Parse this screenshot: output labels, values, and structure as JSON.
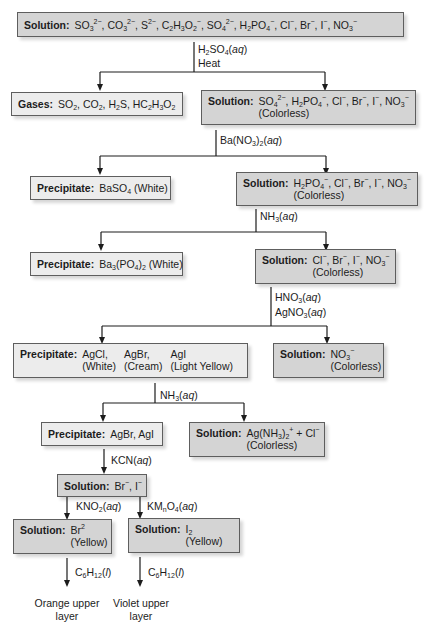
{
  "diagram": {
    "type": "flowchart",
    "nodes": {
      "start": {
        "label": "Solution:",
        "html": "SO<sub>3</sub><sup>2&minus;</sup>, CO<sub>3</sub><sup>2&minus;</sup>, S<sup>2&minus;</sup>, C<sub>2</sub>H<sub>3</sub>O<sub>2</sub><sup>&minus;</sup>, SO<sub>4</sub><sup>2&minus;</sup>, H<sub>2</sub>PO<sub>4</sub><sup>&minus;</sup>, Cl<sup>&minus;</sup>, Br<sup>&minus;</sup>, I<sup>&minus;</sup>, NO<sub>3</sub><sup>&minus;</sup>",
        "text": "SO3^2-, CO3^2-, S^2-, C2H3O2^-, SO4^2-, H2PO4^-, Cl^-, Br^-, I^-, NO3^-"
      },
      "gases": {
        "label": "Gases:",
        "html": "SO<sub>2</sub>, CO<sub>2</sub>, H<sub>2</sub>S, HC<sub>2</sub>H<sub>3</sub>O<sub>2</sub>",
        "text": "SO2, CO2, H2S, HC2H3O2"
      },
      "sol1": {
        "label": "Solution:",
        "html": "SO<sub>4</sub><sup>2&minus;</sup>, H<sub>2</sub>PO<sub>4</sub><sup>&minus;</sup>, Cl<sup>&minus;</sup>, Br<sup>&minus;</sup>, I<sup>&minus;</sup>, NO<sub>3</sub><sup>&minus;</sup>",
        "text": "SO4^2-, H2PO4^-, Cl^-, Br^-, I^-, NO3^-",
        "note": "(Colorless)"
      },
      "ppt1": {
        "label": "Precipitate:",
        "html": "BaSO<sub>4</sub> (White)",
        "text": "BaSO4 (White)"
      },
      "sol2": {
        "label": "Solution:",
        "html": "H<sub>2</sub>PO<sub>4</sub><sup>&minus;</sup>, Cl<sup>&minus;</sup>, Br<sup>&minus;</sup>, I<sup>&minus;</sup>, NO<sub>3</sub><sup>&minus;</sup>",
        "text": "H2PO4^-, Cl^-, Br^-, I^-, NO3^-",
        "note": "(Colorless)"
      },
      "ppt2": {
        "label": "Precipitate:",
        "html": "Ba<sub>3</sub>(PO<sub>4</sub>)<sub>2</sub> (White)",
        "text": "Ba3(PO4)2 (White)"
      },
      "sol3": {
        "label": "Solution:",
        "html": "Cl<sup>&minus;</sup>, Br<sup>&minus;</sup>, I<sup>&minus;</sup>, NO<sub>3</sub><sup>&minus;</sup>",
        "text": "Cl^-, Br^-, I^-, NO3^-",
        "note": "(Colorless)"
      },
      "ppt3": {
        "label": "Precipitate:",
        "columns": [
          {
            "compound": "AgCl,",
            "color": "(White)"
          },
          {
            "compound": "AgBr,",
            "color": "(Cream)"
          },
          {
            "compound": "AgI",
            "color": "(Light Yellow)"
          }
        ]
      },
      "sol4": {
        "label": "Solution:",
        "html": "NO<sub>3</sub><sup>&minus;</sup>",
        "text": "NO3^-",
        "note": "(Colorless)"
      },
      "ppt4": {
        "label": "Precipitate:",
        "html": "AgBr, AgI",
        "text": "AgBr, AgI"
      },
      "sol5": {
        "label": "Solution:",
        "html": "Ag(NH<sub>3</sub>)<sub>2</sub><sup>+</sup> + Cl<sup>&minus;</sup>",
        "text": "Ag(NH3)2^+ + Cl^-",
        "note": "(Colorless)"
      },
      "sol6": {
        "label": "Solution:",
        "html": "Br<sup>&minus;</sup>, I<sup>&minus;</sup>",
        "text": "Br^-, I^-"
      },
      "sol7": {
        "label": "Solution:",
        "html": "Br<sup>2</sup>",
        "text": "Br^2",
        "note": "(Yellow)"
      },
      "sol8": {
        "label": "Solution:",
        "html": "I<sub>2</sub>",
        "text": "I2",
        "note": "(Yellow)"
      },
      "res1": {
        "line1": "Orange upper",
        "line2": "layer"
      },
      "res2": {
        "line1": "Violet upper",
        "line2": "layer"
      }
    },
    "reagents": {
      "r1a": {
        "html": "H<sub>2</sub>SO<sub>4</sub>(<i>aq</i>)",
        "text": "H2SO4(aq)"
      },
      "r1b": {
        "html": "Heat",
        "text": "Heat"
      },
      "r2": {
        "html": "Ba(NO<sub>3</sub>)<sub>2</sub>(<i>aq</i>)",
        "text": "Ba(NO3)2(aq)"
      },
      "r3": {
        "html": "NH<sub>3</sub>(<i>aq</i>)",
        "text": "NH3(aq)"
      },
      "r4a": {
        "html": "HNO<sub>3</sub>(<i>aq</i>)",
        "text": "HNO3(aq)"
      },
      "r4b": {
        "html": "AgNO<sub>3</sub>(<i>aq</i>)",
        "text": "AgNO3(aq)"
      },
      "r5": {
        "html": "NH<sub>3</sub>(<i>aq</i>)",
        "text": "NH3(aq)"
      },
      "r6": {
        "html": "KCN(<i>aq</i>)",
        "text": "KCN(aq)"
      },
      "r7": {
        "html": "KNO<sub>2</sub>(<i>aq</i>)",
        "text": "KNO2(aq)"
      },
      "r8": {
        "html": "KM<sub>n</sub>O<sub>4</sub>(<i>aq</i>)",
        "text": "KMnO4(aq)"
      },
      "r9": {
        "html": "C<sub>6</sub>H<sub>12</sub>(<i>l</i>)",
        "text": "C6H12(l)"
      },
      "r10": {
        "html": "C<sub>6</sub>H<sub>12</sub>(<i>l</i>)",
        "text": "C6H12(l)"
      }
    },
    "edges": [
      {
        "from": "start",
        "to": [
          "gases",
          "sol1"
        ],
        "reagent": [
          "r1a",
          "r1b"
        ]
      },
      {
        "from": "sol1",
        "to": [
          "ppt1",
          "sol2"
        ],
        "reagent": [
          "r2"
        ]
      },
      {
        "from": "sol2",
        "to": [
          "ppt2",
          "sol3"
        ],
        "reagent": [
          "r3"
        ]
      },
      {
        "from": "sol3",
        "to": [
          "ppt3",
          "sol4"
        ],
        "reagent": [
          "r4a",
          "r4b"
        ]
      },
      {
        "from": "ppt3",
        "to": [
          "ppt4",
          "sol5"
        ],
        "reagent": [
          "r5"
        ]
      },
      {
        "from": "ppt4",
        "to": [
          "sol6"
        ],
        "reagent": [
          "r6"
        ]
      },
      {
        "from": "sol6",
        "to": [
          "sol7"
        ],
        "reagent": [
          "r7"
        ]
      },
      {
        "from": "sol6",
        "to": [
          "sol8"
        ],
        "reagent": [
          "r8"
        ]
      },
      {
        "from": "sol7",
        "to": [
          "res1"
        ],
        "reagent": [
          "r9"
        ]
      },
      {
        "from": "sol8",
        "to": [
          "res2"
        ],
        "reagent": [
          "r10"
        ]
      }
    ],
    "colors": {
      "solution_fill": "#d4d4d4",
      "precipitate_fill": "#ececec",
      "line": "#1c1c1c"
    }
  }
}
